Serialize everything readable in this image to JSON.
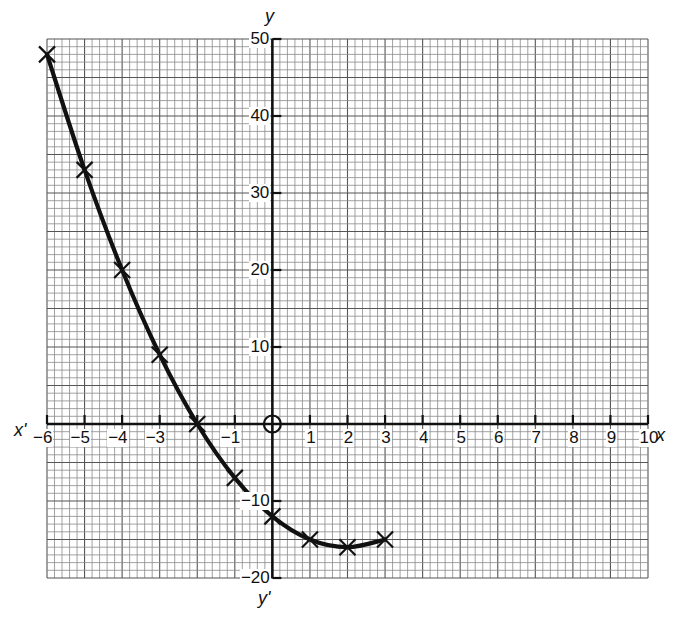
{
  "chart_data": {
    "type": "line",
    "title": "",
    "xlabel": "x",
    "xlabel_neg": "x'",
    "ylabel": "y",
    "ylabel_neg": "y'",
    "xlim": [
      -6,
      10
    ],
    "ylim": [
      -20,
      50
    ],
    "grid": true,
    "legend": null,
    "x_ticks": [
      -6,
      -5,
      -4,
      -3,
      -1,
      1,
      2,
      3,
      4,
      5,
      6,
      7,
      8,
      9,
      10
    ],
    "x_tick_labels": [
      "−6",
      "−5",
      "−4",
      "−3",
      "−1",
      "1",
      "2",
      "3",
      "4",
      "5",
      "6",
      "7",
      "8",
      "9",
      "10"
    ],
    "y_ticks": [
      50,
      40,
      30,
      20,
      10,
      -10,
      -20
    ],
    "y_tick_labels": [
      "50",
      "40",
      "30",
      "20",
      "10",
      "−10",
      "−20"
    ],
    "origin_marker": "circle",
    "series": [
      {
        "name": "y = x² − 4x − 12",
        "marker": "x",
        "x": [
          -6,
          -5,
          -4,
          -3,
          -2,
          -1,
          0,
          1,
          2,
          3
        ],
        "y": [
          48,
          33,
          20,
          9,
          0,
          -7,
          -12,
          -15,
          -16,
          -15
        ]
      }
    ]
  }
}
